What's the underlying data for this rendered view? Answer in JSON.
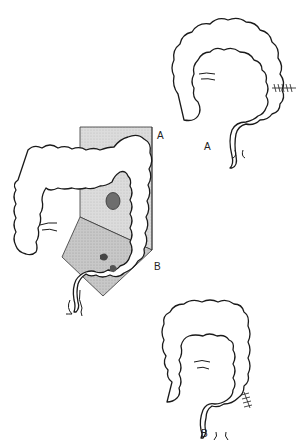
{
  "figure": {
    "labels": {
      "region_a": "A",
      "region_b": "B",
      "result_a": "A",
      "result_b": "B"
    },
    "colors": {
      "shade_a": "#d9d9d9",
      "shade_b": "#c4c4c4",
      "lesion": "#6e6e6e",
      "outline": "#1a1a1a"
    }
  }
}
